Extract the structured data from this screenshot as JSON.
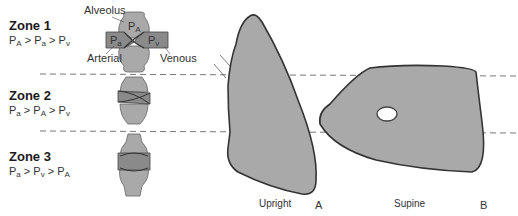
{
  "zones": [
    {
      "title": "Zone 1",
      "p1": "P",
      "s1": "A",
      "p2": "P",
      "s2": "a",
      "p3": "P",
      "s3": "v",
      "op": " > "
    },
    {
      "title": "Zone 2",
      "p1": "P",
      "s1": "a",
      "p2": "P",
      "s2": "A",
      "p3": "P",
      "s3": "v",
      "op": " > "
    },
    {
      "title": "Zone 3",
      "p1": "P",
      "s1": "a",
      "p2": "P",
      "s2": "v",
      "p3": "P",
      "s3": "A",
      "op": " > "
    }
  ],
  "zone1_labels": {
    "alveolus": "Alveolus",
    "arterial": "Arterial",
    "venous": "Venous",
    "pA": "P",
    "pA_sub": "A",
    "pa": "P",
    "pa_sub": "a",
    "pv": "P",
    "pv_sub": "v"
  },
  "panels": {
    "upright": {
      "caption": "Upright",
      "letter": "A"
    },
    "supine": {
      "caption": "Supine",
      "letter": "B"
    }
  },
  "colors": {
    "fill": "#a9a9a9",
    "vessel": "#8a8a8a",
    "stroke": "#3a3a3a",
    "dash": "#777777"
  }
}
